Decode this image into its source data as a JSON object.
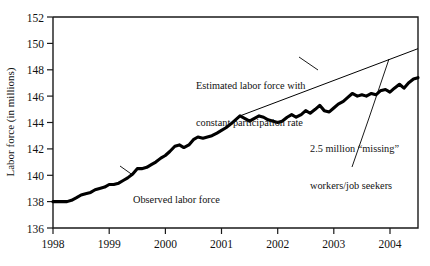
{
  "chart_data": {
    "type": "line",
    "title": "",
    "xlabel": "",
    "ylabel": "Labor force (in millions)",
    "xlim": [
      1998.0,
      2004.5
    ],
    "ylim": [
      136,
      152
    ],
    "grid": false,
    "legend": "none",
    "xticks": [
      "1998",
      "1999",
      "2000",
      "2001",
      "2002",
      "2003",
      "2004"
    ],
    "xtick_values": [
      1998,
      1999,
      2000,
      2001,
      2002,
      2003,
      2004
    ],
    "yticks": [
      "136",
      "138",
      "140",
      "142",
      "144",
      "146",
      "148",
      "150",
      "152"
    ],
    "ytick_values": [
      136,
      138,
      140,
      142,
      144,
      146,
      148,
      150,
      152
    ],
    "series": [
      {
        "name": "Observed labor force",
        "style": "thick-solid",
        "x": [
          1998.0,
          1998.08,
          1998.17,
          1998.25,
          1998.33,
          1998.42,
          1998.5,
          1998.58,
          1998.67,
          1998.75,
          1998.83,
          1998.92,
          1999.0,
          1999.08,
          1999.17,
          1999.25,
          1999.33,
          1999.42,
          1999.5,
          1999.58,
          1999.67,
          1999.75,
          1999.83,
          1999.92,
          2000.0,
          2000.08,
          2000.17,
          2000.25,
          2000.33,
          2000.42,
          2000.5,
          2000.58,
          2000.67,
          2000.75,
          2000.83,
          2000.92,
          2001.0,
          2001.08,
          2001.17,
          2001.25,
          2001.33,
          2001.42,
          2001.5,
          2001.58,
          2001.67,
          2001.75,
          2001.83,
          2001.92,
          2002.0,
          2002.08,
          2002.17,
          2002.25,
          2002.33,
          2002.42,
          2002.5,
          2002.58,
          2002.67,
          2002.75,
          2002.83,
          2002.92,
          2003.0,
          2003.08,
          2003.17,
          2003.25,
          2003.33,
          2003.42,
          2003.5,
          2003.58,
          2003.67,
          2003.75,
          2003.83,
          2003.92,
          2004.0,
          2004.08,
          2004.17,
          2004.25,
          2004.33,
          2004.42,
          2004.5
        ],
        "y": [
          138.0,
          138.0,
          138.0,
          138.0,
          138.1,
          138.3,
          138.5,
          138.6,
          138.7,
          138.9,
          139.0,
          139.1,
          139.3,
          139.3,
          139.4,
          139.6,
          139.8,
          140.1,
          140.5,
          140.5,
          140.6,
          140.8,
          141.0,
          141.3,
          141.5,
          141.8,
          142.2,
          142.3,
          142.1,
          142.3,
          142.7,
          142.9,
          142.8,
          142.9,
          143.0,
          143.2,
          143.4,
          143.6,
          143.9,
          144.2,
          144.5,
          144.3,
          144.1,
          144.3,
          144.5,
          144.4,
          144.2,
          144.1,
          144.0,
          144.1,
          144.4,
          144.6,
          144.4,
          144.6,
          144.9,
          144.7,
          145.0,
          145.3,
          144.9,
          144.8,
          145.1,
          145.4,
          145.6,
          145.9,
          146.2,
          146.0,
          146.1,
          146.0,
          146.2,
          146.1,
          146.4,
          146.5,
          146.3,
          146.6,
          146.9,
          146.6,
          147.0,
          147.3,
          147.4
        ]
      },
      {
        "name": "Estimated labor force with constant participation rate",
        "style": "thin-solid",
        "x": [
          2001.33,
          2004.5
        ],
        "y": [
          144.5,
          149.6
        ]
      }
    ],
    "annotations": [
      {
        "id": "trend-label",
        "text_lines": [
          "Estimated labor force with",
          "constant participation rate"
        ],
        "leader": true
      },
      {
        "id": "observed-label",
        "text_lines": [
          "Observed labor force"
        ],
        "leader": true
      },
      {
        "id": "gap-label",
        "text_lines": [
          "2.5 million “missing”",
          "workers/job seekers"
        ],
        "leader": true,
        "value": 2.5
      }
    ]
  },
  "axes": {
    "y_axis_title": "Labor force (in millions)",
    "y_ticks": [
      "152",
      "150",
      "148",
      "146",
      "144",
      "142",
      "140",
      "138",
      "136"
    ],
    "x_ticks": [
      "1998",
      "1999",
      "2000",
      "2001",
      "2002",
      "2003",
      "2004"
    ]
  },
  "annotations": {
    "trend_line_1": "Estimated labor force with",
    "trend_line_2": "constant participation rate",
    "observed": "Observed labor force",
    "missing_line_1": "2.5 million “missing”",
    "missing_line_2": "workers/job seekers"
  },
  "colors": {
    "ink": "#000000",
    "axis": "#1a1a1a",
    "background": "#ffffff"
  }
}
